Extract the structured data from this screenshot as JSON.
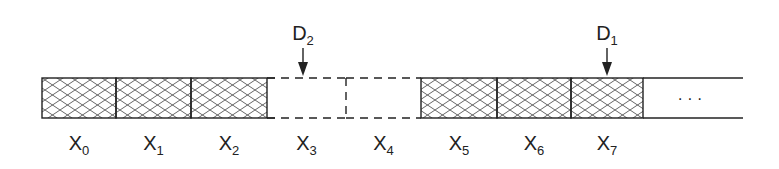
{
  "diagram": {
    "title": "",
    "cells": [
      {
        "label": "X",
        "sub": "0",
        "state": "filled",
        "x0": 42,
        "x1": 116
      },
      {
        "label": "X",
        "sub": "1",
        "state": "filled",
        "x0": 116,
        "x1": 191
      },
      {
        "label": "X",
        "sub": "2",
        "state": "filled",
        "x0": 191,
        "x1": 267
      },
      {
        "label": "X",
        "sub": "3",
        "state": "empty-dashed",
        "x0": 267,
        "x1": 346
      },
      {
        "label": "X",
        "sub": "4",
        "state": "empty-dashed",
        "x0": 346,
        "x1": 421
      },
      {
        "label": "X",
        "sub": "5",
        "state": "filled",
        "x0": 421,
        "x1": 497
      },
      {
        "label": "X",
        "sub": "6",
        "state": "filled",
        "x0": 497,
        "x1": 571
      },
      {
        "label": "X",
        "sub": "7",
        "state": "filled",
        "x0": 571,
        "x1": 643
      }
    ],
    "tail": {
      "x0": 643,
      "x1": 743,
      "ellipsis": "· · ·"
    },
    "pointers": [
      {
        "label": "D",
        "sub": "2",
        "x": 303
      },
      {
        "label": "D",
        "sub": "1",
        "x": 607
      }
    ],
    "colors": {
      "stroke": "#222222",
      "hatch": "#555555",
      "background": "#ffffff"
    }
  }
}
